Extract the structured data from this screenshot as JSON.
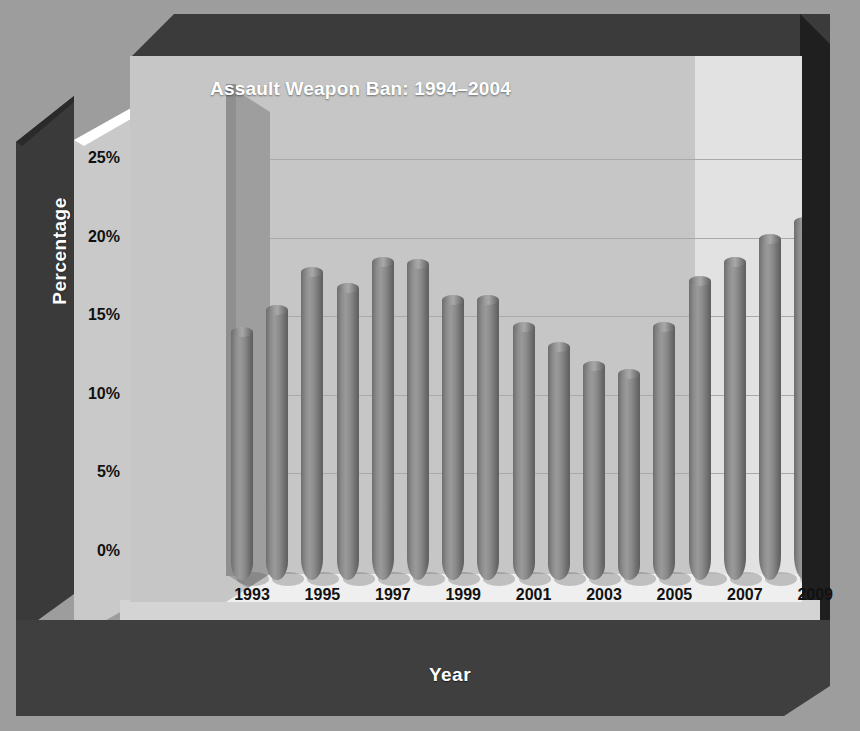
{
  "chart_data": {
    "type": "bar",
    "title": "Assault Weapon Ban: 1994–2004",
    "xlabel": "Year",
    "ylabel": "Percentage",
    "ylim": [
      0,
      27.5
    ],
    "ytick_values": [
      0,
      5,
      10,
      15,
      20,
      25
    ],
    "ytick_labels": [
      "0%",
      "5%",
      "10%",
      "15%",
      "20%",
      "25%"
    ],
    "grid": true,
    "legend": "none",
    "categories": [
      "1993",
      "1994",
      "1995",
      "1996",
      "1997",
      "1998",
      "1999",
      "2000",
      "2001",
      "2002",
      "2003",
      "2004",
      "2005",
      "2006",
      "2007",
      "2008",
      "2009",
      "2010"
    ],
    "xtick_labels": [
      "1993",
      "1995",
      "1997",
      "1999",
      "2001",
      "2003",
      "2005",
      "2007",
      "2009"
    ],
    "values": [
      15.8,
      17.2,
      19.6,
      18.6,
      20.2,
      20.1,
      17.8,
      17.8,
      16.1,
      14.8,
      13.6,
      13.1,
      16.1,
      19.0,
      20.2,
      21.7,
      22.8,
      23.6
    ],
    "shaded_region": {
      "label": "Assault Weapon Ban: 1994–2004",
      "start_category": "1994",
      "end_category": "2004"
    },
    "bar_style": "3d-cylinder",
    "colors": {
      "bar": "#8a8a8a",
      "plot_background": "#e2e2e2",
      "shaded_background": "#c6c6c6",
      "frame": "#3f3f3f",
      "title_text": "#ffffff",
      "axis_text": "#111111"
    }
  }
}
